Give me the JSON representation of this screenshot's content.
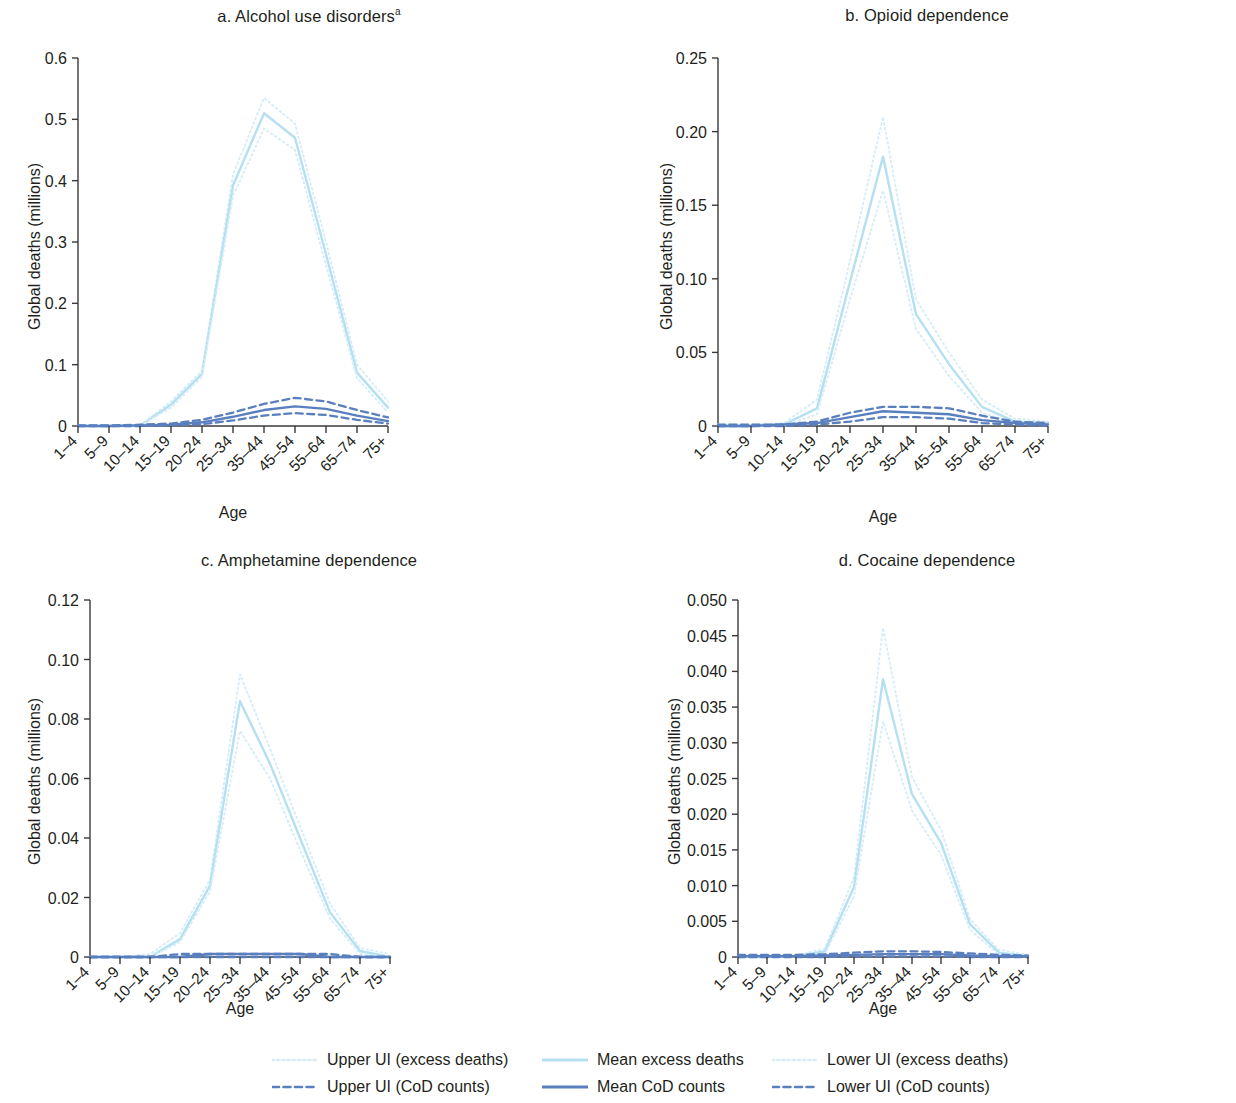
{
  "figure": {
    "axis_label_x": "Age",
    "axis_label_y": "Global deaths (millions)"
  },
  "legend": {
    "items": [
      {
        "label": "Upper UI (excess deaths)",
        "style": "dotted",
        "color": "#d6edf8"
      },
      {
        "label": "Mean excess deaths",
        "style": "solid",
        "color": "#b5e0f2"
      },
      {
        "label": "Lower UI (excess deaths)",
        "style": "dotted",
        "color": "#d6edf8"
      },
      {
        "label": "Upper UI (CoD counts)",
        "style": "dashed",
        "color": "#5a7fbe"
      },
      {
        "label": "Mean CoD counts",
        "style": "solid",
        "color": "#5a7fbe"
      },
      {
        "label": "Lower UI (CoD counts)",
        "style": "dashed",
        "color": "#5a7fbe"
      }
    ]
  },
  "chart_data": [
    {
      "type": "line",
      "panel": "a",
      "title": "a. Alcohol use disorders",
      "title_superscript": "a",
      "xlabel": "Age",
      "ylabel": "Global deaths (millions)",
      "categories": [
        "1–4",
        "5–9",
        "10–14",
        "15–19",
        "20–24",
        "25–34",
        "35–44",
        "45–54",
        "55–64",
        "65–74",
        "75+"
      ],
      "ylim": [
        0,
        0.6
      ],
      "yticks": [
        0,
        0.1,
        0.2,
        0.3,
        0.4,
        0.5,
        0.6
      ],
      "ytick_labels": [
        "0",
        "0.1",
        "0.2",
        "0.3",
        "0.4",
        "0.5",
        "0.6"
      ],
      "grid": false,
      "series": [
        {
          "name": "Upper UI (excess deaths)",
          "style": "dotted",
          "color": "#d6edf8",
          "values": [
            0.0,
            0.0,
            0.001,
            0.04,
            0.09,
            0.41,
            0.535,
            0.493,
            0.3,
            0.1,
            0.04
          ]
        },
        {
          "name": "Mean excess deaths",
          "style": "solid",
          "color": "#b5e0f2",
          "values": [
            0.0,
            0.0,
            0.0,
            0.035,
            0.085,
            0.392,
            0.51,
            0.47,
            0.28,
            0.087,
            0.03
          ]
        },
        {
          "name": "Lower UI (excess deaths)",
          "style": "dotted",
          "color": "#d6edf8",
          "values": [
            0.0,
            0.0,
            0.0,
            0.03,
            0.08,
            0.375,
            0.485,
            0.45,
            0.262,
            0.078,
            0.022
          ]
        },
        {
          "name": "Upper UI (CoD counts)",
          "style": "dashed",
          "color": "#5a7fbe",
          "values": [
            0.001,
            0.001,
            0.002,
            0.004,
            0.01,
            0.022,
            0.036,
            0.046,
            0.04,
            0.026,
            0.014
          ]
        },
        {
          "name": "Mean CoD counts",
          "style": "solid",
          "color": "#5a7fbe",
          "values": [
            0.0,
            0.0,
            0.001,
            0.002,
            0.006,
            0.015,
            0.026,
            0.032,
            0.028,
            0.017,
            0.008
          ]
        },
        {
          "name": "Lower UI (CoD counts)",
          "style": "dashed",
          "color": "#5a7fbe",
          "values": [
            0.0,
            0.0,
            0.0,
            0.001,
            0.003,
            0.009,
            0.017,
            0.021,
            0.018,
            0.01,
            0.004
          ]
        }
      ]
    },
    {
      "type": "line",
      "panel": "b",
      "title": "b. Opioid dependence",
      "xlabel": "Age",
      "ylabel": "Global deaths (millions)",
      "categories": [
        "1–4",
        "5–9",
        "10–14",
        "15–19",
        "20–24",
        "25–34",
        "35–44",
        "45–54",
        "55–64",
        "65–74",
        "75+"
      ],
      "ylim": [
        0,
        0.25
      ],
      "yticks": [
        0,
        0.05,
        0.1,
        0.15,
        0.2,
        0.25
      ],
      "ytick_labels": [
        "0",
        "0.05",
        "0.10",
        "0.15",
        "0.20",
        "0.25"
      ],
      "grid": false,
      "series": [
        {
          "name": "Upper UI (excess deaths)",
          "style": "dotted",
          "color": "#d6edf8",
          "values": [
            0.001,
            0.001,
            0.002,
            0.018,
            0.112,
            0.21,
            0.086,
            0.05,
            0.018,
            0.005,
            0.003
          ]
        },
        {
          "name": "Mean excess deaths",
          "style": "solid",
          "color": "#b5e0f2",
          "values": [
            0.0,
            0.0,
            0.001,
            0.012,
            0.098,
            0.183,
            0.076,
            0.042,
            0.013,
            0.003,
            0.002
          ]
        },
        {
          "name": "Lower UI (excess deaths)",
          "style": "dotted",
          "color": "#d6edf8",
          "values": [
            0.0,
            0.0,
            0.0,
            0.008,
            0.086,
            0.16,
            0.066,
            0.034,
            0.009,
            0.002,
            0.001
          ]
        },
        {
          "name": "Upper UI (CoD counts)",
          "style": "dashed",
          "color": "#5a7fbe",
          "values": [
            0.001,
            0.001,
            0.001,
            0.003,
            0.009,
            0.013,
            0.013,
            0.012,
            0.007,
            0.003,
            0.002
          ]
        },
        {
          "name": "Mean CoD counts",
          "style": "solid",
          "color": "#5a7fbe",
          "values": [
            0.0,
            0.0,
            0.001,
            0.002,
            0.006,
            0.01,
            0.009,
            0.008,
            0.004,
            0.002,
            0.001
          ]
        },
        {
          "name": "Lower UI (CoD counts)",
          "style": "dashed",
          "color": "#5a7fbe",
          "values": [
            0.0,
            0.0,
            0.0,
            0.001,
            0.003,
            0.006,
            0.006,
            0.005,
            0.002,
            0.001,
            0.0
          ]
        }
      ]
    },
    {
      "type": "line",
      "panel": "c",
      "title": "c. Amphetamine dependence",
      "xlabel": "Age",
      "ylabel": "Global deaths (millions)",
      "categories": [
        "1–4",
        "5–9",
        "10–14",
        "15–19",
        "20–24",
        "25–34",
        "35–44",
        "45–54",
        "55–64",
        "65–74",
        "75+"
      ],
      "ylim": [
        0,
        0.12
      ],
      "yticks": [
        0,
        0.02,
        0.04,
        0.06,
        0.08,
        0.1,
        0.12
      ],
      "ytick_labels": [
        "0",
        "0.02",
        "0.04",
        "0.06",
        "0.08",
        "0.10",
        "0.12"
      ],
      "grid": false,
      "series": [
        {
          "name": "Upper UI (excess deaths)",
          "style": "dotted",
          "color": "#d6edf8",
          "values": [
            0.0,
            0.0,
            0.001,
            0.008,
            0.026,
            0.095,
            0.07,
            0.044,
            0.018,
            0.003,
            0.001
          ]
        },
        {
          "name": "Mean excess deaths",
          "style": "solid",
          "color": "#b5e0f2",
          "values": [
            0.0,
            0.0,
            0.0,
            0.006,
            0.024,
            0.086,
            0.065,
            0.04,
            0.015,
            0.002,
            0.0
          ]
        },
        {
          "name": "Lower UI (excess deaths)",
          "style": "dotted",
          "color": "#d6edf8",
          "values": [
            0.0,
            0.0,
            0.0,
            0.005,
            0.022,
            0.076,
            0.06,
            0.036,
            0.013,
            0.001,
            0.0
          ]
        },
        {
          "name": "Upper UI (CoD counts)",
          "style": "dashed",
          "color": "#5a7fbe",
          "values": [
            0.0,
            0.0,
            0.0,
            0.001,
            0.001,
            0.001,
            0.001,
            0.001,
            0.001,
            0.0,
            0.0
          ]
        },
        {
          "name": "Mean CoD counts",
          "style": "solid",
          "color": "#5a7fbe",
          "values": [
            0.0,
            0.0,
            0.0,
            0.0,
            0.001,
            0.001,
            0.001,
            0.001,
            0.0,
            0.0,
            0.0
          ]
        },
        {
          "name": "Lower UI (CoD counts)",
          "style": "dashed",
          "color": "#5a7fbe",
          "values": [
            0.0,
            0.0,
            0.0,
            0.0,
            0.0,
            0.0,
            0.0,
            0.0,
            0.0,
            0.0,
            0.0
          ]
        }
      ]
    },
    {
      "type": "line",
      "panel": "d",
      "title": "d. Cocaine dependence",
      "xlabel": "Age",
      "ylabel": "Global deaths (millions)",
      "categories": [
        "1–4",
        "5–9",
        "10–14",
        "15–19",
        "20–24",
        "25–34",
        "35–44",
        "45–54",
        "55–64",
        "65–74",
        "75+"
      ],
      "ylim": [
        0,
        0.05
      ],
      "yticks": [
        0,
        0.005,
        0.01,
        0.015,
        0.02,
        0.025,
        0.03,
        0.035,
        0.04,
        0.045,
        0.05
      ],
      "ytick_labels": [
        "0",
        "0.005",
        "0.010",
        "0.015",
        "0.020",
        "0.025",
        "0.030",
        "0.035",
        "0.040",
        "0.045",
        "0.050"
      ],
      "grid": false,
      "series": [
        {
          "name": "Upper UI (excess deaths)",
          "style": "dotted",
          "color": "#d6edf8",
          "values": [
            0.0,
            0.0,
            0.0002,
            0.0012,
            0.0112,
            0.0461,
            0.0252,
            0.0178,
            0.0053,
            0.001,
            0.0003
          ]
        },
        {
          "name": "Mean excess deaths",
          "style": "solid",
          "color": "#b5e0f2",
          "values": [
            0.0,
            0.0,
            0.0001,
            0.0008,
            0.0098,
            0.0389,
            0.0228,
            0.016,
            0.0046,
            0.0006,
            0.0001
          ]
        },
        {
          "name": "Lower UI (excess deaths)",
          "style": "dotted",
          "color": "#d6edf8",
          "values": [
            0.0,
            0.0,
            0.0,
            0.0005,
            0.0085,
            0.033,
            0.0205,
            0.0143,
            0.0038,
            0.0003,
            0.0
          ]
        },
        {
          "name": "Upper UI (CoD counts)",
          "style": "dashed",
          "color": "#5a7fbe",
          "values": [
            0.0003,
            0.0003,
            0.0003,
            0.0004,
            0.0006,
            0.0008,
            0.0008,
            0.0007,
            0.0005,
            0.0003,
            0.0002
          ]
        },
        {
          "name": "Mean CoD counts",
          "style": "solid",
          "color": "#5a7fbe",
          "values": [
            0.0001,
            0.0001,
            0.0001,
            0.0002,
            0.0003,
            0.0004,
            0.0004,
            0.0004,
            0.0002,
            0.0001,
            0.0001
          ]
        },
        {
          "name": "Lower UI (CoD counts)",
          "style": "dashed",
          "color": "#5a7fbe",
          "values": [
            0.0,
            0.0,
            0.0,
            0.0,
            0.0001,
            0.0001,
            0.0001,
            0.0001,
            0.0,
            0.0,
            0.0
          ]
        }
      ]
    }
  ]
}
